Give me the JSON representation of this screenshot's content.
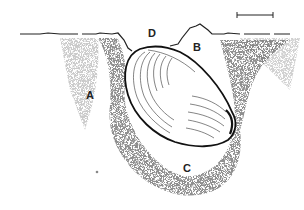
{
  "diagram": {
    "labels": {
      "A": "A",
      "B": "B",
      "C": "C",
      "D": "D"
    },
    "scale_bar": "scale-bar",
    "colors": {
      "ink": "#111111",
      "sediment": "#444444",
      "background": "#ffffff"
    }
  }
}
